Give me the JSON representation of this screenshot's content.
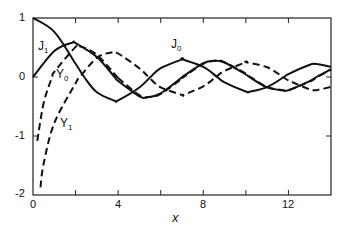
{
  "chart_data": {
    "type": "line",
    "title": "",
    "xlabel": "x",
    "ylabel": "",
    "xlim": [
      0,
      14
    ],
    "ylim": [
      -2,
      1
    ],
    "grid": false,
    "legend": "inline curve labels",
    "x_ticks": [
      0,
      4,
      8,
      12
    ],
    "x_minor_ticks": [
      2,
      6,
      10
    ],
    "y_ticks": [
      -2,
      -1,
      0,
      1
    ],
    "series": [
      {
        "name": "J0",
        "style": "solid",
        "x": [
          0,
          1,
          2,
          2.405,
          3,
          3.832,
          4,
          5,
          5.52,
          6,
          7,
          7.016,
          8,
          8.654,
          9,
          10,
          10.17,
          11,
          11.79,
          12,
          13,
          13.32,
          14
        ],
        "values": [
          1,
          0.765,
          0.224,
          0,
          -0.26,
          -0.403,
          -0.397,
          -0.178,
          0,
          0.151,
          0.3,
          0.3,
          0.172,
          0,
          -0.09,
          -0.246,
          -0.25,
          -0.171,
          0,
          0.048,
          0.207,
          0.218,
          0.171
        ]
      },
      {
        "name": "J1",
        "style": "solid",
        "x": [
          0,
          1,
          1.841,
          2,
          3,
          3.832,
          4,
          5,
          5.331,
          6,
          7,
          7.016,
          8,
          8.536,
          9,
          10,
          10.17,
          11,
          11.71,
          12,
          13,
          13.32,
          14
        ],
        "values": [
          0,
          0.44,
          0.582,
          0.577,
          0.339,
          0,
          -0.066,
          -0.328,
          -0.346,
          -0.277,
          -0.005,
          0,
          0.235,
          0.273,
          0.245,
          0.043,
          0,
          -0.177,
          -0.223,
          -0.223,
          -0.07,
          0,
          0.133
        ]
      },
      {
        "name": "Y0",
        "style": "dashed",
        "x": [
          0.2,
          0.5,
          0.894,
          1,
          2,
          2.197,
          3,
          3.958,
          4,
          5,
          5.43,
          6,
          7,
          7.086,
          8,
          8.596,
          9,
          10,
          10.22,
          11,
          11.75,
          12,
          13,
          13.36,
          14
        ],
        "values": [
          -1.081,
          -0.444,
          0,
          0.088,
          0.51,
          0.521,
          0.377,
          0,
          -0.017,
          -0.309,
          -0.341,
          -0.288,
          -0.026,
          0,
          0.224,
          0.279,
          0.25,
          0.056,
          0,
          -0.169,
          -0.223,
          -0.225,
          -0.078,
          0,
          0.127
        ]
      },
      {
        "name": "Y1",
        "style": "dashed",
        "x": [
          0.35,
          0.5,
          1,
          2,
          2.197,
          3,
          3.683,
          4,
          5,
          5.43,
          6,
          7,
          7.086,
          8,
          8.596,
          9,
          10,
          10.02,
          11,
          11.75,
          12,
          13,
          13.36,
          14
        ],
        "values": [
          -1.87,
          -1.471,
          -0.781,
          -0.107,
          0,
          0.325,
          0.417,
          0.398,
          0.148,
          0,
          -0.175,
          -0.303,
          -0.3,
          -0.158,
          0,
          0.104,
          0.249,
          0.25,
          0.164,
          0,
          -0.057,
          -0.21,
          -0.218,
          -0.167
        ]
      }
    ],
    "annotations": [
      {
        "text": "J0",
        "x": 6.6,
        "y": 0.55
      },
      {
        "text": "J1",
        "x": 0.3,
        "y": 0.55
      },
      {
        "text": "Y0",
        "x": 1.15,
        "y": 0.1
      },
      {
        "text": "Y1",
        "x": 1.3,
        "y": -0.75
      }
    ]
  },
  "labels": {
    "j0": {
      "main": "J",
      "sub": "0"
    },
    "j1": {
      "main": "J",
      "sub": "1"
    },
    "y0": {
      "main": "Y",
      "sub": "0"
    },
    "y1": {
      "main": "Y",
      "sub": "1"
    },
    "xlabel": "x",
    "xticks": [
      "0",
      "4",
      "8",
      "12"
    ],
    "yticks": [
      "1",
      "0",
      "-1",
      "-2"
    ]
  }
}
